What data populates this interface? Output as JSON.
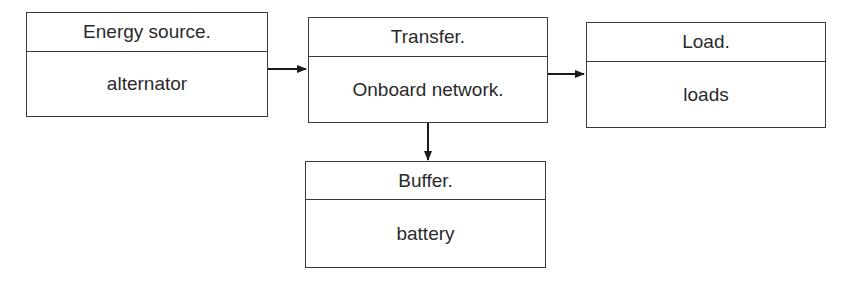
{
  "diagram": {
    "nodes": [
      {
        "id": "energy-source",
        "title": "Energy source.",
        "content": "alternator"
      },
      {
        "id": "transfer",
        "title": "Transfer.",
        "content": "Onboard network."
      },
      {
        "id": "load",
        "title": "Load.",
        "content": "loads"
      },
      {
        "id": "buffer",
        "title": "Buffer.",
        "content": "battery"
      }
    ],
    "edges": [
      {
        "from": "energy-source",
        "to": "transfer"
      },
      {
        "from": "transfer",
        "to": "load"
      },
      {
        "from": "transfer",
        "to": "buffer"
      }
    ],
    "colors": {
      "stroke": "#3a3a3a",
      "text": "#2a2a2a",
      "background": "#ffffff"
    }
  }
}
